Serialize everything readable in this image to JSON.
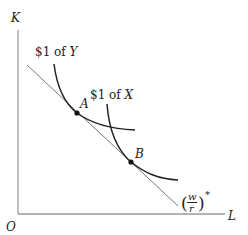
{
  "diagram": {
    "axes": {
      "y_label": "K",
      "x_label": "L",
      "origin_label": "O"
    },
    "curves": [
      {
        "name": "isocost-Y",
        "label_prefix": "$1 of ",
        "label_var": "Y"
      },
      {
        "name": "isocost-X",
        "label_prefix": "$1 of ",
        "label_var": "X"
      }
    ],
    "points": [
      {
        "label": "A"
      },
      {
        "label": "B"
      }
    ],
    "line": {
      "label_num": "w",
      "label_den": "r",
      "label_sup": "*",
      "label_open": "(",
      "label_close": ")"
    },
    "colors": {
      "axis": "#999999",
      "curve": "#222222",
      "line": "#666666",
      "point": "#111111"
    }
  }
}
